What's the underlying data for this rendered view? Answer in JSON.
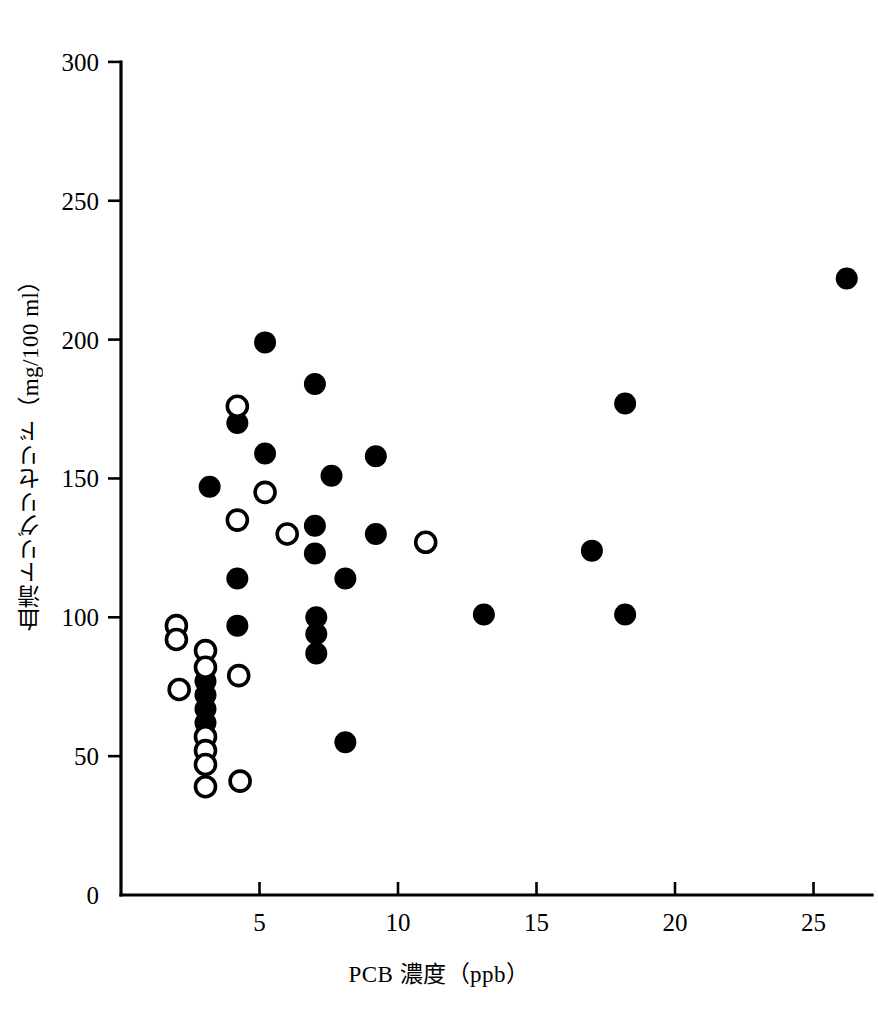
{
  "chart_data": {
    "type": "scatter",
    "title": "",
    "xlabel": "PCB 濃度（ppb）",
    "ylabel": "血清トリグリセリド（mg/100 ml）",
    "xlim": [
      0,
      27.5
    ],
    "ylim": [
      0,
      300
    ],
    "xticks": [
      5,
      10,
      15,
      20,
      25
    ],
    "yticks": [
      0,
      50,
      100,
      150,
      200,
      250,
      300
    ],
    "xtick_labels": [
      "5",
      "10",
      "15",
      "20",
      "25"
    ],
    "ytick_labels": [
      "0",
      "50",
      "100",
      "150",
      "200",
      "250",
      "300"
    ],
    "grid": false,
    "legend": "none",
    "series": [
      {
        "name": "filled-circles",
        "marker": "filled circle",
        "color": "#000000",
        "points": [
          [
            3.05,
            77
          ],
          [
            3.05,
            72
          ],
          [
            3.05,
            67
          ],
          [
            3.05,
            62
          ],
          [
            3.2,
            147
          ],
          [
            4.2,
            170
          ],
          [
            4.2,
            114
          ],
          [
            4.2,
            97
          ],
          [
            5.2,
            199
          ],
          [
            5.2,
            159
          ],
          [
            7.0,
            184
          ],
          [
            7.0,
            133
          ],
          [
            7.0,
            123
          ],
          [
            7.05,
            100
          ],
          [
            7.05,
            94
          ],
          [
            7.05,
            87
          ],
          [
            7.6,
            151
          ],
          [
            8.1,
            114
          ],
          [
            8.1,
            55
          ],
          [
            9.2,
            158
          ],
          [
            9.2,
            130
          ],
          [
            13.1,
            101
          ],
          [
            17.0,
            124
          ],
          [
            18.2,
            177
          ],
          [
            18.2,
            101
          ],
          [
            26.2,
            222
          ]
        ]
      },
      {
        "name": "open-circles",
        "marker": "open circle",
        "color": "#000000",
        "points": [
          [
            2.0,
            97
          ],
          [
            2.0,
            92
          ],
          [
            2.1,
            74
          ],
          [
            3.05,
            88
          ],
          [
            3.05,
            82
          ],
          [
            3.05,
            57
          ],
          [
            3.05,
            52
          ],
          [
            3.05,
            47
          ],
          [
            3.05,
            39
          ],
          [
            4.2,
            176
          ],
          [
            4.2,
            135
          ],
          [
            4.25,
            79
          ],
          [
            4.3,
            41
          ],
          [
            5.2,
            145
          ],
          [
            6.0,
            130
          ],
          [
            11.0,
            127
          ]
        ]
      }
    ],
    "axis": {
      "x_origin_px": 121,
      "y_origin_px": 895,
      "x_scale_px_per_unit": 27.7,
      "y_scale_px_per_unit": 2.777
    }
  }
}
